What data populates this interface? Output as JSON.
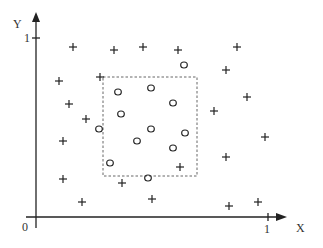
{
  "diagram": {
    "axes": {
      "x_label": "X",
      "y_label": "Y",
      "origin_label": "0",
      "x_tick_label": "1",
      "y_tick_label": "1",
      "color": "#222222"
    },
    "region_box": {
      "style": "dashed",
      "x": 103,
      "y": 77,
      "width": 94,
      "height": 99,
      "color": "#666666"
    },
    "plus_points": [
      [
        73,
        47
      ],
      [
        114,
        50
      ],
      [
        143,
        47
      ],
      [
        178,
        50
      ],
      [
        237,
        47
      ],
      [
        59,
        81
      ],
      [
        100,
        77
      ],
      [
        226,
        70
      ],
      [
        69,
        104
      ],
      [
        247,
        97
      ],
      [
        86,
        119
      ],
      [
        214,
        111
      ],
      [
        63,
        141
      ],
      [
        265,
        137
      ],
      [
        226,
        157
      ],
      [
        180,
        167
      ],
      [
        63,
        179
      ],
      [
        122,
        183
      ],
      [
        82,
        202
      ],
      [
        152,
        199
      ],
      [
        229,
        206
      ],
      [
        258,
        202
      ]
    ],
    "circle_points": [
      [
        184,
        65
      ],
      [
        118,
        92
      ],
      [
        151,
        88
      ],
      [
        173,
        103
      ],
      [
        121,
        114
      ],
      [
        99,
        129
      ],
      [
        151,
        129
      ],
      [
        185,
        133
      ],
      [
        137,
        141
      ],
      [
        173,
        148
      ],
      [
        110,
        163
      ],
      [
        148,
        178
      ]
    ],
    "marker_color": "#222222"
  }
}
